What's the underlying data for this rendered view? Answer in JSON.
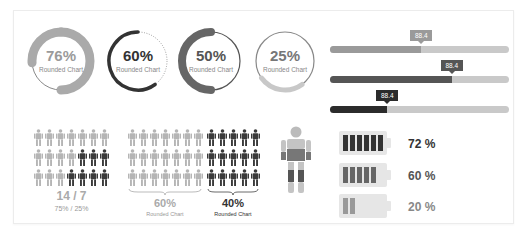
{
  "colors": {
    "light": "#aaaaaa",
    "lighter": "#c8c8c8",
    "mid": "#666666",
    "dark": "#333333",
    "track": "#c9c9c9",
    "text_dark": "#333333",
    "text_mid": "#555555",
    "text_light": "#888888"
  },
  "donuts": [
    {
      "pct": "76%",
      "value": 76,
      "label": "Rounded Chart",
      "style": "thick-light"
    },
    {
      "pct": "60%",
      "value": 60,
      "label": "Rounded Chart",
      "style": "thin-dark-dotted"
    },
    {
      "pct": "50%",
      "value": 50,
      "label": "Rounded Chart",
      "style": "thick-mid"
    },
    {
      "pct": "25%",
      "value": 25,
      "label": "Rounded Chart",
      "style": "thin-light"
    }
  ],
  "progress_bars": [
    {
      "tooltip": "88.4",
      "fill_fraction": 0.51,
      "tone": "light"
    },
    {
      "tooltip": "88.4",
      "fill_fraction": 0.68,
      "tone": "mid"
    },
    {
      "tooltip": "88.4",
      "fill_fraction": 0.32,
      "tone": "dark"
    }
  ],
  "people_group_1": {
    "rows": [
      [
        "light",
        "light",
        "light",
        "light",
        "light",
        "light",
        "light"
      ],
      [
        "light",
        "light",
        "light",
        "light",
        "dark",
        "dark",
        "dark"
      ],
      [
        "light",
        "light",
        "light",
        "dark",
        "dark",
        "dark",
        "dark"
      ]
    ],
    "ratio": "14 / 7",
    "percent": "75% / 25%"
  },
  "people_group_2": {
    "light_count": 21,
    "dark_count": 15,
    "light_pct": "60%",
    "light_label": "Rounded Chart",
    "dark_pct": "40%",
    "dark_label": "Rounded Chart"
  },
  "human_figure": {
    "icon": "human-body-icon"
  },
  "batteries": [
    {
      "label": "72 %",
      "cells": 6,
      "tone": "dark"
    },
    {
      "label": "60 %",
      "cells": 5,
      "tone": "mid"
    },
    {
      "label": "20 %",
      "cells": 2,
      "tone": "light"
    }
  ]
}
